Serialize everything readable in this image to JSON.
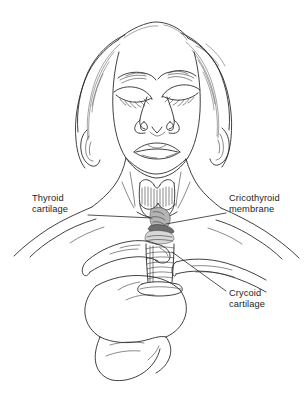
{
  "figure": {
    "background_color": "#fefefe",
    "ink_color": "#2b2b2b"
  },
  "labels": [
    {
      "id": "thyroid-cartilage",
      "line1": "Thyroid",
      "line2": "cartilage",
      "side": "left"
    },
    {
      "id": "cricothyroid-membrane",
      "line1": "Cricothyroid",
      "line2": "membrane",
      "side": "right"
    },
    {
      "id": "crycoid-cartilage",
      "line1": "Crycoid",
      "line2": "cartilage",
      "side": "right"
    }
  ],
  "anatomy_parts": [
    "face",
    "closed-eyes",
    "nose",
    "mouth",
    "hair",
    "ears",
    "neck",
    "clavicles",
    "shoulders",
    "hand",
    "index-finger",
    "thumb",
    "thyroid-cartilage",
    "cricothyroid-membrane",
    "cricoid-cartilage",
    "tracheal-rings"
  ]
}
